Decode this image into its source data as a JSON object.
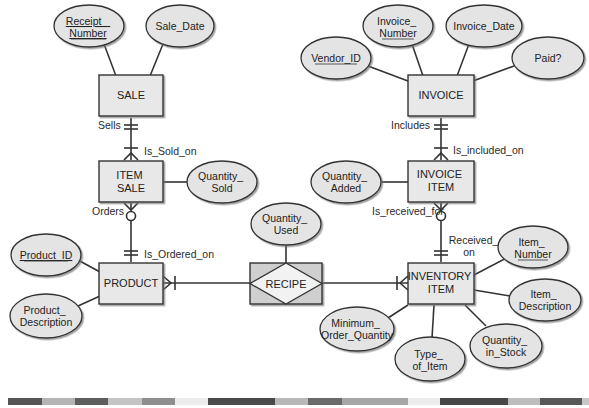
{
  "entities": [
    {
      "id": "sale",
      "label": [
        "SALE"
      ]
    },
    {
      "id": "item_sale",
      "label": [
        "ITEM",
        "SALE"
      ]
    },
    {
      "id": "product",
      "label": [
        "PRODUCT"
      ]
    },
    {
      "id": "invoice",
      "label": [
        "INVOICE"
      ]
    },
    {
      "id": "invoice_item",
      "label": [
        "INVOICE",
        "ITEM"
      ]
    },
    {
      "id": "inventory_item",
      "label": [
        "INVENTORY",
        "ITEM"
      ]
    }
  ],
  "associative_entity": {
    "id": "recipe",
    "label": "RECIPE"
  },
  "attributes": {
    "receipt_number": [
      "Receipt_",
      "Number"
    ],
    "sale_date": [
      "Sale_Date"
    ],
    "quantity_sold": [
      "Quantity_",
      "Sold"
    ],
    "product_id": [
      "Product_ID"
    ],
    "product_description": [
      "Product_",
      "Description"
    ],
    "quantity_used": [
      "Quantity_",
      "Used"
    ],
    "vendor_id": [
      "Vendor_ID"
    ],
    "invoice_number": [
      "Invoice_",
      "Number"
    ],
    "invoice_date": [
      "Invoice_Date"
    ],
    "paid": [
      "Paid?"
    ],
    "quantity_added": [
      "Quantity_",
      "Added"
    ],
    "item_number": [
      "Item_",
      "Number"
    ],
    "item_description": [
      "Item_",
      "Description"
    ],
    "minimum_order_quantity": [
      "Minimum_",
      "Order_Quantity"
    ],
    "type_of_item": [
      "Type_",
      "of_Item"
    ],
    "quantity_in_stock": [
      "Quantity_",
      "in_Stock"
    ]
  },
  "relationship_labels": {
    "sells": "Sells",
    "is_sold_on": "Is_Sold_on",
    "orders": "Orders",
    "is_ordered_on": "Is_Ordered_on",
    "includes": "Includes",
    "is_included_on": "Is_included_on",
    "is_received_for": "Is_received_for",
    "received_on": [
      "Received_",
      "on"
    ]
  },
  "colors": {
    "entity_fill": "#e8e8e8",
    "attribute_fill": "#e4e4e4",
    "recipe_fill": "#cfcfcf",
    "stroke": "#333333"
  },
  "footer_bar": [
    {
      "x": 8,
      "w": 34,
      "color": "#555555"
    },
    {
      "x": 42,
      "w": 33,
      "color": "#b4b4b4"
    },
    {
      "x": 75,
      "w": 33,
      "color": "#5e5e5e"
    },
    {
      "x": 108,
      "w": 34,
      "color": "#c4c4c4"
    },
    {
      "x": 142,
      "w": 33,
      "color": "#8e8e8e"
    },
    {
      "x": 175,
      "w": 33,
      "color": "#ececec"
    },
    {
      "x": 208,
      "w": 67,
      "color": "#4a4a4a"
    },
    {
      "x": 275,
      "w": 33,
      "color": "#b8b8b8"
    },
    {
      "x": 308,
      "w": 34,
      "color": "#6a6a6a"
    },
    {
      "x": 342,
      "w": 66,
      "color": "#a6a6a6"
    },
    {
      "x": 408,
      "w": 32,
      "color": "#ececec"
    },
    {
      "x": 440,
      "w": 68,
      "color": "#474747"
    },
    {
      "x": 508,
      "w": 32,
      "color": "#bdbdbd"
    },
    {
      "x": 540,
      "w": 42,
      "color": "#585858"
    },
    {
      "x": 582,
      "w": 7,
      "color": "#c8c8c8"
    }
  ]
}
